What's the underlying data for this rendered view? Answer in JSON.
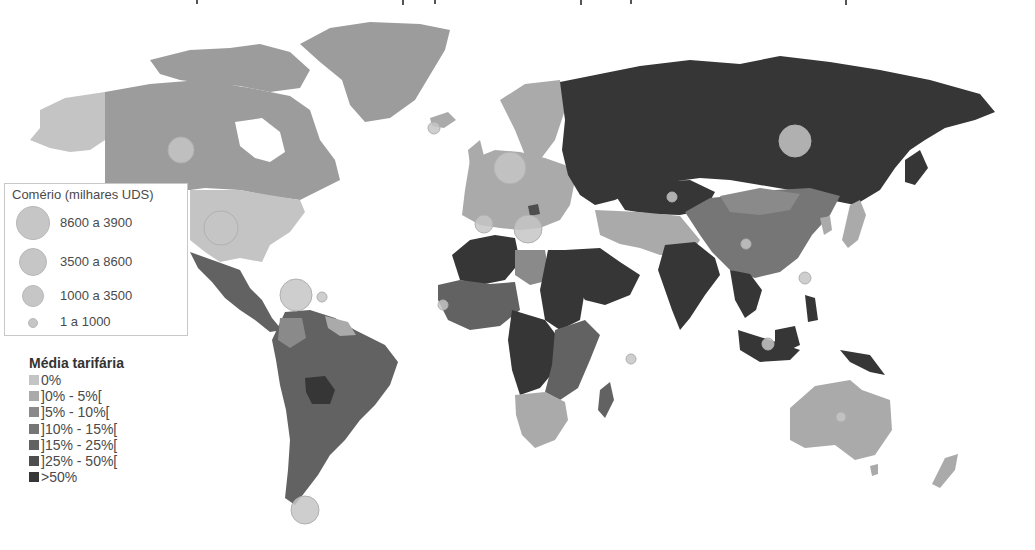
{
  "caption_fragment": "(top caption text cut off — only descenders visible)",
  "trade_legend": {
    "title": "Comério (milhares UDS)",
    "classes": [
      {
        "label": "8600 a 3900",
        "diameter": 34
      },
      {
        "label": "3500 a 8600",
        "diameter": 28
      },
      {
        "label": "1000 a 3500",
        "diameter": 22
      },
      {
        "label": "1 a 1000",
        "diameter": 10
      }
    ],
    "bubble_color": "#c6c6c6"
  },
  "tariff_legend": {
    "title": "Média tarifária",
    "classes": [
      {
        "label": "0%",
        "color": "#c4c4c4"
      },
      {
        "label": "]0% - 5%[",
        "color": "#aaaaaa"
      },
      {
        "label": "]5% - 10%[",
        "color": "#8a8a8a"
      },
      {
        "label": "]10% - 15%[",
        "color": "#767676"
      },
      {
        "label": "]15% - 25%[",
        "color": "#626262"
      },
      {
        "label": "]25% - 50%[",
        "color": "#4e4e4e"
      },
      {
        "label": ">50%",
        "color": "#363636"
      }
    ]
  },
  "regions": [
    {
      "name": "Alaska (USA)",
      "class": "0%"
    },
    {
      "name": "Canada",
      "class": "]0% - 5%["
    },
    {
      "name": "Greenland",
      "class": "]0% - 5%["
    },
    {
      "name": "USA",
      "class": "0%"
    },
    {
      "name": "Mexico / Central America",
      "class": "]15% - 25%["
    },
    {
      "name": "South America (Brazil, Argentina, ...)",
      "class": "]15% - 25%["
    },
    {
      "name": "Bolivia",
      "class": ">50%"
    },
    {
      "name": "Europe",
      "class": "]0% - 5%["
    },
    {
      "name": "Russia",
      "class": ">50%"
    },
    {
      "name": "Kazakhstan",
      "class": ">50%"
    },
    {
      "name": "China / Mongolia",
      "class": "]5% - 10%["
    },
    {
      "name": "Middle East / Central Asia",
      "class": "]0% - 5%["
    },
    {
      "name": "Saudi Arabia / Egypt",
      "class": ">50%"
    },
    {
      "name": "India / Pakistan",
      "class": ">50%"
    },
    {
      "name": "Southeast Asia / Indonesia",
      "class": ">50%"
    },
    {
      "name": "North Africa (Algeria)",
      "class": ">50%"
    },
    {
      "name": "Libya",
      "class": "]5% - 10%["
    },
    {
      "name": "West Africa",
      "class": "]15% - 25%["
    },
    {
      "name": "Central Africa",
      "class": ">50%"
    },
    {
      "name": "East Africa",
      "class": "]15% - 25%["
    },
    {
      "name": "Southern Africa",
      "class": "]0% - 5%["
    },
    {
      "name": "Madagascar",
      "class": "]15% - 25%["
    },
    {
      "name": "Australia / New Zealand",
      "class": "]0% - 5%["
    },
    {
      "name": "Japan / Korea",
      "class": "]0% - 5%["
    }
  ]
}
